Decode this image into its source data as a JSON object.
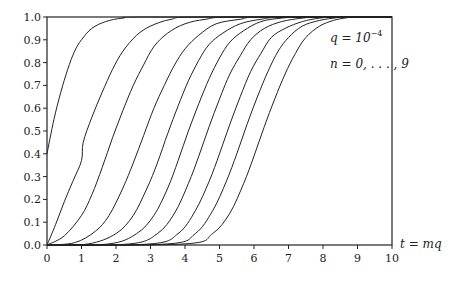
{
  "chart_data": {
    "type": "line",
    "title": "",
    "xlabel": "t = mq",
    "ylabel": "",
    "xlim": [
      0,
      10
    ],
    "ylim": [
      0,
      1
    ],
    "grid": false,
    "legend": null,
    "x_ticks": [
      "0",
      "1",
      "2",
      "3",
      "4",
      "5",
      "6",
      "7",
      "8",
      "9",
      "10"
    ],
    "y_ticks": [
      "0.0",
      "0.1",
      "0.2",
      "0.3",
      "0.4",
      "0.5",
      "0.6",
      "0.7",
      "0.8",
      "0.9",
      "1.0"
    ],
    "annotations": [
      {
        "text": "q = 10",
        "superscript": "−4",
        "x": 8.2,
        "y": 0.88
      },
      {
        "text": "n = 0, . . . , 9",
        "x": 8.2,
        "y": 0.78
      }
    ],
    "series": [
      {
        "name": "n=0",
        "points": [
          [
            0,
            0.4
          ],
          [
            0.2,
            0.55
          ],
          [
            0.4,
            0.67
          ],
          [
            0.6,
            0.77
          ],
          [
            0.8,
            0.85
          ],
          [
            1.0,
            0.9
          ],
          [
            1.3,
            0.95
          ],
          [
            1.7,
            0.98
          ],
          [
            2.2,
            0.995
          ],
          [
            3.0,
            1.0
          ],
          [
            10,
            1.0
          ]
        ]
      },
      {
        "name": "n=1",
        "points": [
          [
            0,
            0.0
          ],
          [
            0.25,
            0.09
          ],
          [
            0.5,
            0.19
          ],
          [
            0.75,
            0.28
          ],
          [
            1.0,
            0.37
          ],
          [
            1.05,
            0.45
          ],
          [
            1.3,
            0.56
          ],
          [
            1.6,
            0.67
          ],
          [
            1.9,
            0.77
          ],
          [
            2.2,
            0.85
          ],
          [
            2.6,
            0.92
          ],
          [
            3.0,
            0.96
          ],
          [
            3.6,
            0.99
          ],
          [
            4.5,
            1.0
          ],
          [
            10,
            1.0
          ]
        ]
      },
      {
        "name": "n=2",
        "points": [
          [
            0,
            0.0
          ],
          [
            0.5,
            0.04
          ],
          [
            1.0,
            0.13
          ],
          [
            1.3,
            0.22
          ],
          [
            1.6,
            0.34
          ],
          [
            1.9,
            0.47
          ],
          [
            2.2,
            0.59
          ],
          [
            2.5,
            0.7
          ],
          [
            2.8,
            0.79
          ],
          [
            3.1,
            0.87
          ],
          [
            3.5,
            0.93
          ],
          [
            4.0,
            0.97
          ],
          [
            4.6,
            0.99
          ],
          [
            5.5,
            1.0
          ],
          [
            10,
            1.0
          ]
        ]
      },
      {
        "name": "n=3",
        "points": [
          [
            0,
            0.0
          ],
          [
            0.8,
            0.01
          ],
          [
            1.4,
            0.06
          ],
          [
            1.8,
            0.13
          ],
          [
            2.2,
            0.25
          ],
          [
            2.5,
            0.36
          ],
          [
            2.8,
            0.48
          ],
          [
            3.1,
            0.6
          ],
          [
            3.4,
            0.7
          ],
          [
            3.7,
            0.79
          ],
          [
            4.0,
            0.86
          ],
          [
            4.4,
            0.92
          ],
          [
            4.9,
            0.97
          ],
          [
            5.6,
            0.99
          ],
          [
            6.3,
            1.0
          ],
          [
            10,
            1.0
          ]
        ]
      },
      {
        "name": "n=4",
        "points": [
          [
            0,
            0.0
          ],
          [
            1.2,
            0.005
          ],
          [
            2.0,
            0.05
          ],
          [
            2.5,
            0.13
          ],
          [
            2.9,
            0.25
          ],
          [
            3.2,
            0.36
          ],
          [
            3.5,
            0.49
          ],
          [
            3.8,
            0.61
          ],
          [
            4.1,
            0.72
          ],
          [
            4.4,
            0.81
          ],
          [
            4.7,
            0.88
          ],
          [
            5.1,
            0.93
          ],
          [
            5.6,
            0.97
          ],
          [
            6.2,
            0.99
          ],
          [
            7.0,
            1.0
          ],
          [
            10,
            1.0
          ]
        ]
      },
      {
        "name": "n=5",
        "points": [
          [
            0,
            0.0
          ],
          [
            1.8,
            0.005
          ],
          [
            2.6,
            0.05
          ],
          [
            3.1,
            0.13
          ],
          [
            3.5,
            0.25
          ],
          [
            3.8,
            0.37
          ],
          [
            4.1,
            0.5
          ],
          [
            4.4,
            0.62
          ],
          [
            4.7,
            0.73
          ],
          [
            5.0,
            0.82
          ],
          [
            5.3,
            0.89
          ],
          [
            5.7,
            0.94
          ],
          [
            6.2,
            0.98
          ],
          [
            6.8,
            0.995
          ],
          [
            7.5,
            1.0
          ],
          [
            10,
            1.0
          ]
        ]
      },
      {
        "name": "n=6",
        "points": [
          [
            0,
            0.0
          ],
          [
            2.4,
            0.005
          ],
          [
            3.2,
            0.05
          ],
          [
            3.7,
            0.14
          ],
          [
            4.1,
            0.27
          ],
          [
            4.4,
            0.39
          ],
          [
            4.7,
            0.52
          ],
          [
            5.0,
            0.64
          ],
          [
            5.3,
            0.75
          ],
          [
            5.6,
            0.83
          ],
          [
            5.9,
            0.9
          ],
          [
            6.3,
            0.95
          ],
          [
            6.8,
            0.98
          ],
          [
            7.4,
            0.995
          ],
          [
            8.0,
            1.0
          ],
          [
            10,
            1.0
          ]
        ]
      },
      {
        "name": "n=7",
        "points": [
          [
            0,
            0.0
          ],
          [
            3.0,
            0.005
          ],
          [
            3.8,
            0.05
          ],
          [
            4.3,
            0.15
          ],
          [
            4.7,
            0.28
          ],
          [
            5.0,
            0.4
          ],
          [
            5.3,
            0.53
          ],
          [
            5.6,
            0.65
          ],
          [
            5.9,
            0.76
          ],
          [
            6.2,
            0.84
          ],
          [
            6.5,
            0.91
          ],
          [
            6.9,
            0.95
          ],
          [
            7.4,
            0.98
          ],
          [
            7.9,
            0.995
          ],
          [
            8.4,
            1.0
          ],
          [
            10,
            1.0
          ]
        ]
      },
      {
        "name": "n=8",
        "points": [
          [
            0,
            0.0
          ],
          [
            3.5,
            0.005
          ],
          [
            4.3,
            0.05
          ],
          [
            4.8,
            0.15
          ],
          [
            5.2,
            0.28
          ],
          [
            5.5,
            0.4
          ],
          [
            5.8,
            0.53
          ],
          [
            6.1,
            0.65
          ],
          [
            6.4,
            0.76
          ],
          [
            6.7,
            0.85
          ],
          [
            7.0,
            0.91
          ],
          [
            7.4,
            0.96
          ],
          [
            7.9,
            0.985
          ],
          [
            8.4,
            0.997
          ],
          [
            8.7,
            1.0
          ],
          [
            10,
            1.0
          ]
        ]
      },
      {
        "name": "n=9",
        "points": [
          [
            0,
            0.0
          ],
          [
            4.0,
            0.005
          ],
          [
            4.8,
            0.05
          ],
          [
            5.3,
            0.14
          ],
          [
            5.7,
            0.27
          ],
          [
            6.0,
            0.39
          ],
          [
            6.3,
            0.52
          ],
          [
            6.6,
            0.64
          ],
          [
            6.9,
            0.75
          ],
          [
            7.2,
            0.84
          ],
          [
            7.5,
            0.91
          ],
          [
            7.9,
            0.96
          ],
          [
            8.3,
            0.985
          ],
          [
            8.7,
            0.997
          ],
          [
            9.0,
            1.0
          ],
          [
            10,
            1.0
          ]
        ]
      }
    ]
  },
  "labels": {
    "xlabel": "t = mq",
    "annot_q": "q = 10",
    "annot_q_exp": "−4",
    "annot_n": "n = 0, . . . , 9"
  }
}
